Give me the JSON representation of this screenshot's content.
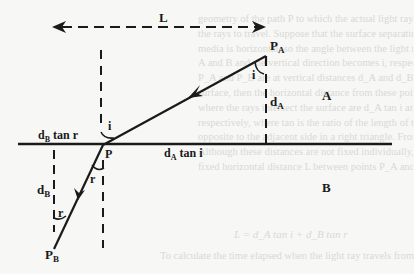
{
  "figure": {
    "type": "refraction-geometry-diagram",
    "labels": {
      "horizontal_distance": "L",
      "point_A": "P",
      "point_A_sub": "A",
      "point_interface": "P",
      "point_B": "P",
      "point_B_sub": "B",
      "angle_incidence_top": "i",
      "angle_incidence_at_P": "i",
      "angle_refraction_at_P": "r",
      "angle_refraction_bottom": "r",
      "depth_A": "d",
      "depth_A_sub": "A",
      "depth_B": "d",
      "depth_B_sub": "B",
      "offset_A": "d",
      "offset_A_sub": "A",
      "offset_A_suffix": " tan i",
      "offset_B": "d",
      "offset_B_sub": "B",
      "offset_B_suffix": " tan r",
      "medium_upper": "A",
      "medium_lower": "B"
    },
    "colors": {
      "ink": "#1a1a1a",
      "paper": "#f7f7f5",
      "bleed_text": "#d9d9d6"
    }
  },
  "background_showthrough": {
    "lines": [
      "geometry of the path P to which the actual light ray...",
      "the rays to travel. Suppose that the surface separating the two",
      "media is horizontal, so the angle between the light rays in media",
      "A and B and the vertical direction becomes i, respectively. If points",
      "P_A and P_B are at vertical distances d_A and d_B from the boundary",
      "surface, then the horizontal distance from these points to the point",
      "where the rays intersect the surface are d_A tan i and d_B tan r",
      "respectively, where tan is the ratio of the length of the side",
      "opposite to the adjacent side in a right triangle. From the figure:",
      "Although these distances are not fixed individually, the total",
      "fixed horizontal distance L between points P_A and P_B is"
    ],
    "equation": "L = d_A tan i + d_B tan r",
    "footer": "To calculate the time elapsed when the light ray travels from"
  }
}
